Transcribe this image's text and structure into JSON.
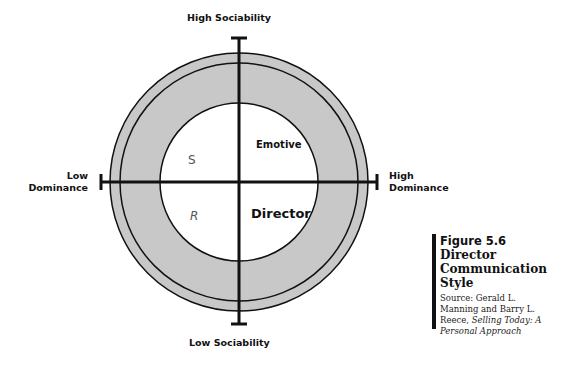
{
  "diagram": {
    "axes": {
      "top": "High Sociability",
      "bottom": "Low Sociability",
      "left_line1": "Low",
      "left_line2": "Dominance",
      "right_line1": "High",
      "right_line2": "Dominance"
    },
    "quadrants": {
      "top_right": "Emotive",
      "bottom_right": "Director",
      "top_left_mark": "S",
      "bottom_left_mark": "R"
    },
    "colors": {
      "ring_fill": "#c8c8c8",
      "line": "#111111",
      "inner_fill": "#ffffff"
    }
  },
  "caption": {
    "figure_number": "Figure 5.6",
    "title_line1": "Director",
    "title_line2": "Communication",
    "title_line3": "Style",
    "source_prefix": "Source: Gerald L. Manning and Barry L. Reece, ",
    "source_italic": "Selling Today: A Personal Approach"
  }
}
